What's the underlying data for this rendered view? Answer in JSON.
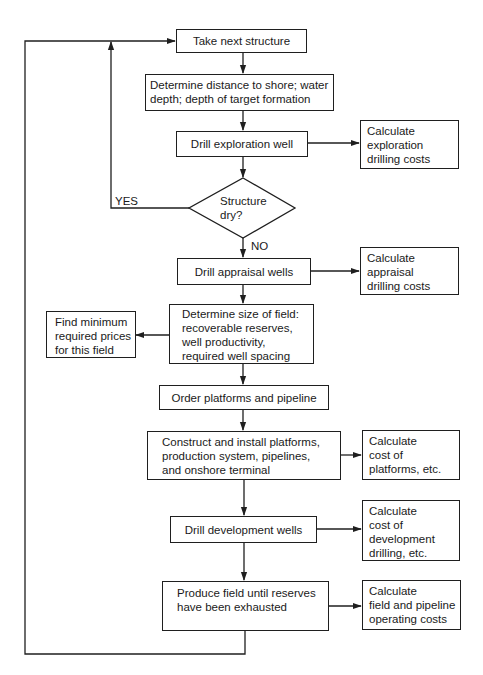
{
  "diagram": {
    "type": "flowchart",
    "colors": {
      "stroke": "#1f1f1f",
      "background": "#ffffff",
      "text": "#1a1a1a"
    },
    "nodes": {
      "take_next": {
        "lines": [
          "Take next structure"
        ]
      },
      "determine_distance": {
        "lines": [
          "Determine distance to shore; water",
          "depth; depth of target formation"
        ]
      },
      "drill_exploration": {
        "lines": [
          "Drill exploration well"
        ]
      },
      "calc_exploration": {
        "lines": [
          "Calculate",
          "exploration",
          "drilling costs"
        ]
      },
      "structure_dry": {
        "lines": [
          "Structure",
          "dry?"
        ]
      },
      "drill_appraisal": {
        "lines": [
          "Drill appraisal wells"
        ]
      },
      "calc_appraisal": {
        "lines": [
          "Calculate",
          "appraisal",
          "drilling costs"
        ]
      },
      "determine_size": {
        "lines": [
          "Determine size of field:",
          "recoverable reserves,",
          "well productivity,",
          "required well spacing"
        ]
      },
      "find_min_prices": {
        "lines": [
          "Find minimum",
          "required prices",
          "for this field"
        ]
      },
      "order_platforms": {
        "lines": [
          "Order platforms and pipeline"
        ]
      },
      "construct_install": {
        "lines": [
          "Construct and install platforms,",
          "production system, pipelines,",
          "and onshore terminal"
        ]
      },
      "calc_platforms": {
        "lines": [
          "Calculate",
          "cost of",
          "platforms, etc."
        ]
      },
      "drill_development": {
        "lines": [
          "Drill development wells"
        ]
      },
      "calc_development": {
        "lines": [
          "Calculate",
          "cost of",
          "development",
          "drilling, etc."
        ]
      },
      "produce_field": {
        "lines": [
          "Produce field until reserves",
          "have been exhausted"
        ]
      },
      "calc_operating": {
        "lines": [
          "Calculate",
          "field and pipeline",
          "operating costs"
        ]
      }
    },
    "edge_labels": {
      "yes": "YES",
      "no": "NO"
    },
    "edges": [
      {
        "from": "take_next",
        "to": "determine_distance"
      },
      {
        "from": "determine_distance",
        "to": "drill_exploration"
      },
      {
        "from": "drill_exploration",
        "to": "calc_exploration"
      },
      {
        "from": "drill_exploration",
        "to": "structure_dry"
      },
      {
        "from": "structure_dry",
        "to": "take_next",
        "label": "YES"
      },
      {
        "from": "structure_dry",
        "to": "drill_appraisal",
        "label": "NO"
      },
      {
        "from": "drill_appraisal",
        "to": "calc_appraisal"
      },
      {
        "from": "drill_appraisal",
        "to": "determine_size"
      },
      {
        "from": "determine_size",
        "to": "find_min_prices"
      },
      {
        "from": "determine_size",
        "to": "order_platforms"
      },
      {
        "from": "order_platforms",
        "to": "construct_install"
      },
      {
        "from": "construct_install",
        "to": "calc_platforms"
      },
      {
        "from": "construct_install",
        "to": "drill_development"
      },
      {
        "from": "drill_development",
        "to": "calc_development"
      },
      {
        "from": "drill_development",
        "to": "produce_field"
      },
      {
        "from": "produce_field",
        "to": "calc_operating"
      },
      {
        "from": "produce_field",
        "to": "take_next"
      }
    ]
  }
}
